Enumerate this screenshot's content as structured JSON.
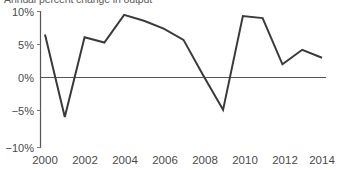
{
  "chart_data": {
    "type": "line",
    "title": "Annual percent change in output",
    "xlabel": "",
    "ylabel": "",
    "x": [
      2000,
      2001,
      2002,
      2003,
      2004,
      2005,
      2006,
      2007,
      2008,
      2009,
      2010,
      2011,
      2012,
      2013,
      2014
    ],
    "values": [
      6.5,
      -6.0,
      6.1,
      5.3,
      9.5,
      8.6,
      7.4,
      5.7,
      0.3,
      -4.9,
      9.3,
      9.0,
      2.0,
      4.2,
      3.0
    ],
    "series": [
      {
        "name": "output",
        "values": [
          6.5,
          -6.0,
          6.1,
          5.3,
          9.5,
          8.6,
          7.4,
          5.7,
          0.3,
          -4.9,
          9.3,
          9.0,
          2.0,
          4.2,
          3.0
        ]
      }
    ],
    "ylim": [
      -10,
      10
    ],
    "xlim": [
      2000,
      2014
    ],
    "yticks": [
      -10,
      -5,
      0,
      5,
      10
    ],
    "ytick_labels": [
      "−10%",
      "−5%",
      "0%",
      "5%",
      "10%"
    ],
    "xticks": [
      2000,
      2002,
      2004,
      2006,
      2008,
      2010,
      2012,
      2014
    ],
    "xtick_labels": [
      "2000",
      "2002",
      "2004",
      "2006",
      "2008",
      "2010",
      "2012",
      "2014"
    ],
    "grid": false,
    "legend": null,
    "legend_position": "none",
    "line_color": "#3a3a3a",
    "axis_color": "#555555",
    "background_color": "#ffffff"
  },
  "axes": {
    "y_labels": [
      "10%",
      "5%",
      "0%",
      "−5%",
      "−10%"
    ],
    "x_labels": [
      "2000",
      "2002",
      "2004",
      "2006",
      "2008",
      "2010",
      "2012",
      "2014"
    ]
  }
}
